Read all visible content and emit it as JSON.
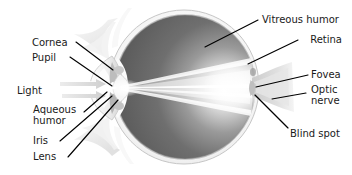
{
  "diagram": {
    "background_color": "#ffffff",
    "label_color": "#1a1a1a",
    "leader_line_color": "#000000",
    "sclera_color": "#f2f2f2",
    "vitreous_dark": "#5d5d5d",
    "vitreous_light": "#fbfbfb",
    "light_ray_color": "#ffffff",
    "light_arrow_color": "#d8d8d8"
  },
  "labels": {
    "cornea": "Cornea",
    "pupil": "Pupil",
    "light": "Light",
    "aqueous_humor_line1": "Aqueous",
    "aqueous_humor_line2": "humor",
    "iris": "Iris",
    "lens": "Lens",
    "vitreous_humor": "Vitreous humor",
    "retina": "Retina",
    "fovea": "Fovea",
    "optic_nerve_line1": "Optic",
    "optic_nerve_line2": "nerve",
    "blind_spot": "Blind spot"
  },
  "parts": [
    {
      "id": "cornea",
      "name": "Cornea",
      "side": "left"
    },
    {
      "id": "pupil",
      "name": "Pupil",
      "side": "left"
    },
    {
      "id": "light",
      "name": "Light",
      "side": "left"
    },
    {
      "id": "aqueous-humor",
      "name": "Aqueous humor",
      "side": "left"
    },
    {
      "id": "iris",
      "name": "Iris",
      "side": "left"
    },
    {
      "id": "lens",
      "name": "Lens",
      "side": "left"
    },
    {
      "id": "vitreous-humor",
      "name": "Vitreous humor",
      "side": "right"
    },
    {
      "id": "retina",
      "name": "Retina",
      "side": "right"
    },
    {
      "id": "fovea",
      "name": "Fovea",
      "side": "right"
    },
    {
      "id": "optic-nerve",
      "name": "Optic nerve",
      "side": "right"
    },
    {
      "id": "blind-spot",
      "name": "Blind spot",
      "side": "right"
    }
  ]
}
